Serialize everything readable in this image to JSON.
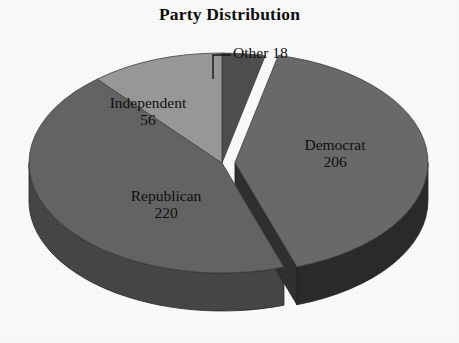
{
  "chart_data": {
    "type": "pie",
    "title": "Party Distribution",
    "subtitle": "",
    "xlabel": "",
    "ylabel": "",
    "grid": false,
    "legend_position": "none",
    "style": "3d-exploded-grayscale",
    "total": 500,
    "categories": [
      "Democrat",
      "Republican",
      "Independent",
      "Other"
    ],
    "values": [
      206,
      220,
      56,
      18
    ],
    "slices": [
      {
        "label": "Democrat",
        "value": 206,
        "value_text": "206",
        "percent": 41.2,
        "angle_deg": 148.3,
        "color": "#6b6b6b",
        "side_color": "#2b2b2b",
        "exploded": true,
        "label_position": "inside-right"
      },
      {
        "label": "Republican",
        "value": 220,
        "value_text": "220",
        "percent": 44.0,
        "angle_deg": 158.4,
        "color": "#656565",
        "side_color": "#474747",
        "exploded": false,
        "label_position": "inside-left"
      },
      {
        "label": "Independent",
        "value": 56,
        "value_text": "56",
        "percent": 11.2,
        "angle_deg": 40.3,
        "color": "#9a9a9a",
        "side_color": "#6e6e6e",
        "exploded": false,
        "label_position": "inside-upper-left"
      },
      {
        "label": "Other",
        "value": 18,
        "value_text": "18",
        "percent": 3.6,
        "angle_deg": 13.0,
        "color": "#4f4f4f",
        "side_color": "#3a3a3a",
        "exploded": false,
        "label_position": "outside-top-leader-line"
      }
    ],
    "annotations": [
      {
        "name": "other-leader-line",
        "text": "Other 18",
        "from": [
          213,
          79
        ],
        "to": [
          231,
          55
        ]
      }
    ],
    "background_color": "#fdfdfd",
    "text_color": "#101010"
  },
  "labels": {
    "democrat": {
      "name": "Democrat",
      "value": "206"
    },
    "republican": {
      "name": "Republican",
      "value": "220"
    },
    "independent": {
      "name": "Independent",
      "value": "56"
    },
    "other": {
      "name": "Other",
      "value": "18",
      "combined": "Other 18"
    }
  }
}
